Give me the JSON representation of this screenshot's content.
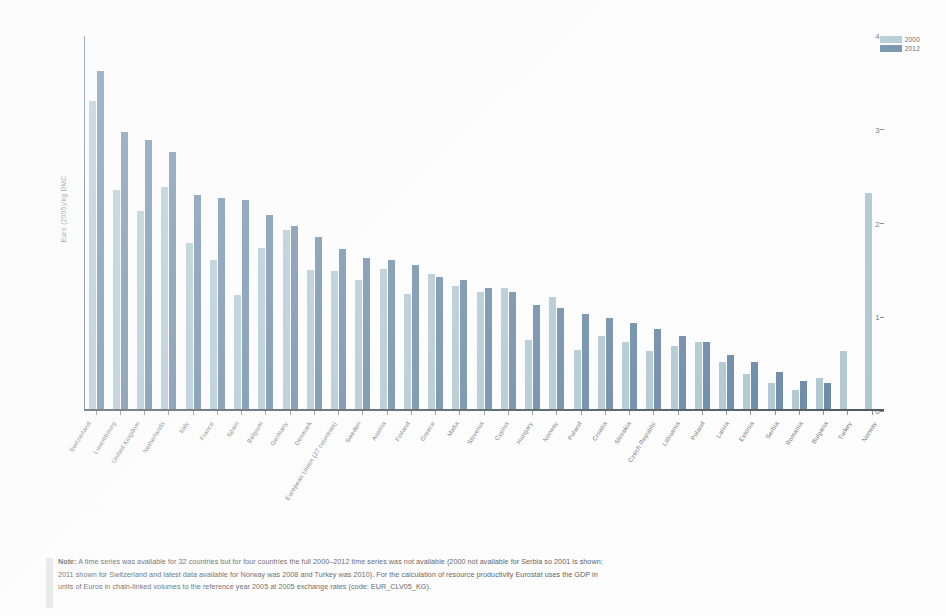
{
  "legend": {
    "position": "top-right",
    "entries": [
      {
        "label": "2000",
        "color": "#a9c3cd"
      },
      {
        "label": "2012",
        "color": "#5d7f9e"
      }
    ]
  },
  "axes": {
    "y_title": "Euro (2005)/kg DMC",
    "y_ticks": [
      "0",
      "1",
      "2",
      "3",
      "4"
    ]
  },
  "note": {
    "label": "Note:",
    "line1": "A time series was available for 32 countries but for four countries the full 2000–2012 time series was not available (2000 not available for Serbia so 2001 is shown;",
    "line2": "2011 shown for Switzerland and latest data available for Norway was 2008 and Turkey was 2010). For the calculation of resource productivity Eurostat uses the GDP in",
    "line3": "units of Euros in chain-linked volumes to the reference year 2005 at 2005 exchange rates (code: EUR_CLV05_KG)."
  },
  "chart_data": {
    "type": "bar",
    "title": "",
    "xlabel": "",
    "ylabel": "Euro (2005)/kg DMC",
    "ylim": [
      0,
      4
    ],
    "yticks": [
      0,
      1,
      2,
      3,
      4
    ],
    "grid": false,
    "legend_position": "top-right",
    "categories": [
      "Switzerland",
      "Luxembourg",
      "United Kingdom",
      "Netherlands",
      "Italy",
      "France",
      "Spain",
      "Belgium",
      "Germany",
      "Denmark",
      "European Union (27 countries)",
      "Sweden",
      "Austria",
      "Finland",
      "Greece",
      "Malta",
      "Slovenia",
      "Cyprus",
      "Hungary",
      "Norway",
      "Poland",
      "Croatia",
      "Slovakia",
      "Czech Republic",
      "Lithuania",
      "Poland",
      "Latvia",
      "Estonia",
      "Serbia",
      "Romania",
      "Bulgaria",
      "Turkey",
      "Norway"
    ],
    "series": [
      {
        "name": "2000",
        "color": "#a9c3cd",
        "values": [
          3.3,
          2.35,
          2.12,
          2.38,
          1.78,
          1.6,
          1.22,
          1.73,
          1.92,
          1.49,
          1.48,
          1.38,
          1.5,
          1.23,
          1.45,
          1.32,
          1.25,
          1.3,
          0.74,
          1.2,
          0.63,
          0.78,
          0.72,
          0.62,
          0.68,
          0.72,
          0.5,
          0.38,
          0.28,
          0.2,
          0.33,
          0.62,
          2.32
        ]
      },
      {
        "name": "2012",
        "color": "#5d7f9e",
        "values": [
          3.62,
          2.97,
          2.88,
          2.76,
          2.3,
          2.26,
          2.24,
          2.08,
          1.96,
          1.84,
          1.72,
          1.62,
          1.6,
          1.54,
          1.42,
          1.38,
          1.3,
          1.26,
          1.12,
          1.08,
          1.02,
          0.98,
          0.92,
          0.86,
          0.78,
          0.72,
          0.58,
          0.5,
          0.4,
          0.3,
          0.28,
          0.0,
          0.0
        ]
      }
    ]
  }
}
